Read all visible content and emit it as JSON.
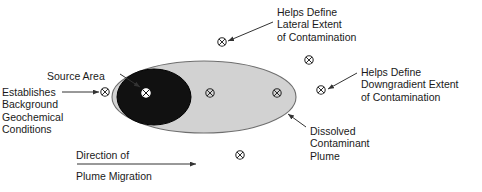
{
  "diagram": {
    "colors": {
      "plume_fill": "#d2d2d2",
      "plume_stroke": "#6e6e6e",
      "source_fill": "#111111",
      "source_stroke": "#000000",
      "text": "#1a1a1a",
      "leader_line": "#333333",
      "well_symbol": "#2b2b2b",
      "well_symbol_inverted": "#ffffff",
      "background": "#ffffff"
    },
    "labels": {
      "source_area": "Source Area",
      "establishes_line1": "Establishes",
      "establishes_line2": "Background",
      "establishes_line3": "Geochemical",
      "establishes_line4": "Conditions",
      "lateral_line1": "Helps Define",
      "lateral_line2": "Lateral Extent",
      "lateral_line3": "of Contamination",
      "downgradient_line1": "Helps Define",
      "downgradient_line2": "Downgradient Extent",
      "downgradient_line3": "of Contamination",
      "dissolved_line1": "Dissolved",
      "dissolved_line2": "Contaminant",
      "dissolved_line3": "Plume",
      "direction_line1": "Direction of",
      "direction_line2": "Plume Migration"
    },
    "shapes": {
      "plume_ellipse": {
        "cx": 204,
        "cy": 97,
        "rx": 92,
        "ry": 36
      },
      "source_ellipse": {
        "cx": 154,
        "cy": 97,
        "rx": 37,
        "ry": 28
      }
    },
    "wells": [
      {
        "name": "well-background-upgradient",
        "x": 105,
        "y": 92,
        "style": "normal"
      },
      {
        "name": "well-source-area",
        "x": 146,
        "y": 93,
        "style": "inverted"
      },
      {
        "name": "well-plume-center",
        "x": 210,
        "y": 93,
        "style": "normal"
      },
      {
        "name": "well-plume-downgradient",
        "x": 277,
        "y": 93,
        "style": "normal"
      },
      {
        "name": "well-lateral-north-left",
        "x": 222,
        "y": 42,
        "style": "normal"
      },
      {
        "name": "well-lateral-north-right",
        "x": 309,
        "y": 60,
        "style": "normal"
      },
      {
        "name": "well-downgradient-east",
        "x": 321,
        "y": 90,
        "style": "normal"
      },
      {
        "name": "well-lateral-south",
        "x": 240,
        "y": 155,
        "style": "normal"
      }
    ],
    "leaders": [
      {
        "name": "leader-source-area",
        "x1": 120,
        "y1": 74,
        "x2": 140,
        "y2": 87,
        "arrow": true
      },
      {
        "name": "leader-establishes",
        "x1": 62,
        "y1": 92,
        "x2": 99,
        "y2": 92,
        "arrow": true
      },
      {
        "name": "leader-lateral",
        "x1": 273,
        "y1": 22,
        "x2": 228,
        "y2": 41,
        "arrow": true
      },
      {
        "name": "leader-downgradient",
        "x1": 357,
        "y1": 73,
        "x2": 328,
        "y2": 89,
        "arrow": true
      },
      {
        "name": "leader-dissolved",
        "x1": 306,
        "y1": 127,
        "x2": 288,
        "y2": 114,
        "arrow": true
      },
      {
        "name": "leader-direction",
        "x1": 77,
        "y1": 164,
        "x2": 196,
        "y2": 164,
        "arrow": true
      }
    ]
  }
}
